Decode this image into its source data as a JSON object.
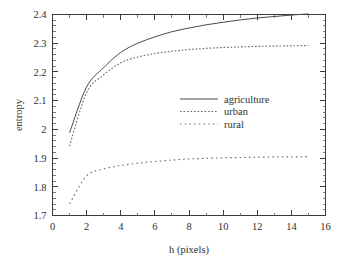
{
  "chart_data": {
    "type": "line",
    "title": "",
    "xlabel": "h (pixels)",
    "ylabel": "entropy",
    "xlim": [
      0,
      16
    ],
    "ylim": [
      1.7,
      2.4
    ],
    "grid": false,
    "legend_position": "center-right",
    "x_ticks": [
      0,
      2,
      4,
      6,
      8,
      10,
      12,
      14,
      16
    ],
    "x_tick_labels": [
      "0",
      "2",
      "4",
      "6",
      "8",
      "10",
      "12",
      "14",
      "16"
    ],
    "x_minor_step": 1,
    "y_ticks": [
      1.7,
      1.8,
      1.9,
      2.0,
      2.1,
      2.2,
      2.3,
      2.4
    ],
    "y_tick_labels": [
      "1.7",
      "1.8",
      "1.9",
      "2",
      "2.1",
      "2.2",
      "2.3",
      "2.4"
    ],
    "y_minor_step": 0.02,
    "x": [
      1,
      2,
      3,
      4,
      5,
      6,
      7,
      8,
      9,
      10,
      11,
      12,
      13,
      14,
      15
    ],
    "series": [
      {
        "name": "agriculture",
        "style": "solid",
        "color": "#4a4a4a",
        "values": [
          1.988,
          2.148,
          2.215,
          2.268,
          2.3,
          2.322,
          2.34,
          2.353,
          2.364,
          2.373,
          2.381,
          2.388,
          2.393,
          2.398,
          2.402
        ]
      },
      {
        "name": "urban",
        "style": "dotted-fine",
        "color": "#6a6a6a",
        "values": [
          1.942,
          2.128,
          2.19,
          2.232,
          2.252,
          2.264,
          2.272,
          2.278,
          2.282,
          2.285,
          2.287,
          2.289,
          2.29,
          2.291,
          2.292
        ]
      },
      {
        "name": "rural",
        "style": "dotted-coarse",
        "color": "#6a6a6a",
        "values": [
          1.741,
          1.838,
          1.862,
          1.874,
          1.882,
          1.888,
          1.893,
          1.897,
          1.899,
          1.901,
          1.902,
          1.903,
          1.904,
          1.904,
          1.905
        ]
      }
    ],
    "legend": [
      {
        "label": "agriculture",
        "style": "solid"
      },
      {
        "label": "urban",
        "style": "dotted-fine"
      },
      {
        "label": "rural",
        "style": "dotted-coarse"
      }
    ]
  }
}
